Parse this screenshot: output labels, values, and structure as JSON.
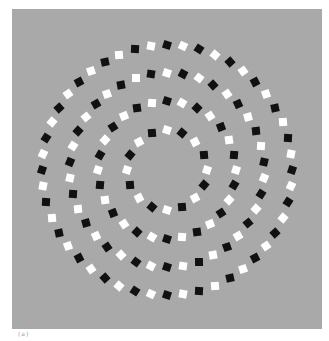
{
  "figure": {
    "caption": "(a)",
    "background_color": "#a9a9a9",
    "colors": {
      "dark": "#111111",
      "light": "#ffffff"
    },
    "center": {
      "x": 155,
      "y": 161
    },
    "square_size": 8,
    "rings": [
      {
        "name": "outer-ring",
        "radius": 125,
        "count": 48,
        "tilt": 18
      },
      {
        "name": "ring-2",
        "radius": 97,
        "count": 38,
        "tilt": 18
      },
      {
        "name": "ring-3",
        "radius": 69,
        "count": 28,
        "tilt": 18
      },
      {
        "name": "inner-ring",
        "radius": 40,
        "count": 16,
        "tilt": 18
      }
    ]
  }
}
